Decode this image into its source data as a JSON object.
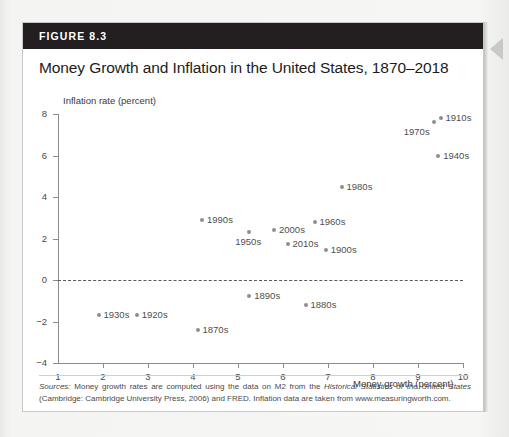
{
  "figure": {
    "label": "FIGURE 8.3",
    "title": "Money Growth and Inflation in the United States, 1870–2018"
  },
  "source": {
    "prefix": "Sources:",
    "text_1": " Money growth rates are computed using the data on M2 from the ",
    "italic_1": "Historical Statistics of the United States",
    "text_2": " (Cambridge: Cambridge University Press, 2006) and FRED. Inflation data are taken from www.measuringworth.com."
  },
  "edge_arrow_icon": "triangle-left-icon",
  "chart_data": {
    "type": "scatter",
    "title": "Money Growth and Inflation in the United States, 1870–2018",
    "xlabel": "Money growth (percent)",
    "ylabel": "Inflation rate (percent)",
    "xlim": [
      1,
      10
    ],
    "ylim": [
      -4,
      8
    ],
    "xticks": [
      1,
      2,
      3,
      4,
      5,
      6,
      7,
      8,
      9,
      10
    ],
    "yticks": [
      -4,
      -2,
      0,
      2,
      4,
      6,
      8
    ],
    "xtick_labels": [
      "1",
      "2",
      "3",
      "4",
      "5",
      "6",
      "7",
      "8",
      "9",
      "10"
    ],
    "ytick_labels": [
      "−4",
      "−2",
      "0",
      "2",
      "4",
      "6",
      "8"
    ],
    "grid": false,
    "legend": "none",
    "reference_lines": [
      {
        "axis": "y",
        "value": 0,
        "style": "dashed"
      }
    ],
    "marker_color": "#8e8e8e",
    "points": [
      {
        "label": "1870s",
        "x": 4.1,
        "y": -2.4,
        "label_pos": "right"
      },
      {
        "label": "1880s",
        "x": 6.5,
        "y": -1.2,
        "label_pos": "right"
      },
      {
        "label": "1890s",
        "x": 5.25,
        "y": -0.75,
        "label_pos": "right"
      },
      {
        "label": "1900s",
        "x": 6.95,
        "y": 1.45,
        "label_pos": "right"
      },
      {
        "label": "1910s",
        "x": 9.5,
        "y": 7.8,
        "label_pos": "right"
      },
      {
        "label": "1920s",
        "x": 2.75,
        "y": -1.7,
        "label_pos": "right"
      },
      {
        "label": "1930s",
        "x": 1.9,
        "y": -1.7,
        "label_pos": "right"
      },
      {
        "label": "1940s",
        "x": 9.45,
        "y": 6.0,
        "label_pos": "right"
      },
      {
        "label": "1950s",
        "x": 5.25,
        "y": 2.3,
        "label_pos": "below"
      },
      {
        "label": "1960s",
        "x": 6.7,
        "y": 2.8,
        "label_pos": "right"
      },
      {
        "label": "1970s",
        "x": 9.35,
        "y": 7.6,
        "label_pos": "below-left"
      },
      {
        "label": "1980s",
        "x": 7.3,
        "y": 4.5,
        "label_pos": "right"
      },
      {
        "label": "1990s",
        "x": 4.2,
        "y": 2.9,
        "label_pos": "right"
      },
      {
        "label": "2000s",
        "x": 5.8,
        "y": 2.4,
        "label_pos": "right"
      },
      {
        "label": "2010s",
        "x": 6.1,
        "y": 1.75,
        "label_pos": "right"
      }
    ]
  }
}
